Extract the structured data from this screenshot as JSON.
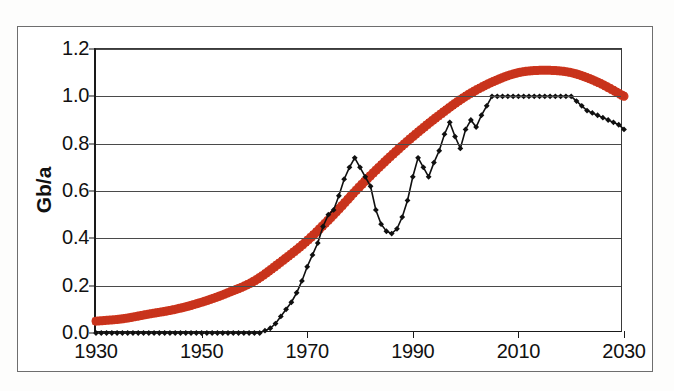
{
  "chart_data": {
    "type": "line",
    "title": "",
    "subtitle": "",
    "xlabel": "",
    "ylabel": "Gb/a",
    "xlim": [
      1930,
      2030
    ],
    "ylim": [
      0.0,
      1.2
    ],
    "xticks": [
      "1930",
      "1950",
      "1970",
      "1990",
      "2010",
      "2030"
    ],
    "xtick_values": [
      1930,
      1950,
      1970,
      1990,
      2010,
      2030
    ],
    "yticks": [
      "0.0",
      "0.2",
      "0.4",
      "0.6",
      "0.8",
      "1.0",
      "1.2"
    ],
    "ytick_values": [
      0.0,
      0.2,
      0.4,
      0.6,
      0.8,
      1.0,
      1.2
    ],
    "grid": "horizontal",
    "legend": "none",
    "colors": {
      "observed": "#101010",
      "model": "#d33a20"
    },
    "series": [
      {
        "name": "observed",
        "style": "black line with diamond markers",
        "x": [
          1930,
          1931,
          1932,
          1933,
          1934,
          1935,
          1936,
          1937,
          1938,
          1939,
          1940,
          1941,
          1942,
          1943,
          1944,
          1945,
          1946,
          1947,
          1948,
          1949,
          1950,
          1951,
          1952,
          1953,
          1954,
          1955,
          1956,
          1957,
          1958,
          1959,
          1960,
          1961,
          1962,
          1963,
          1964,
          1965,
          1966,
          1967,
          1968,
          1969,
          1970,
          1971,
          1972,
          1973,
          1974,
          1975,
          1976,
          1977,
          1978,
          1979,
          1980,
          1981,
          1982,
          1983,
          1984,
          1985,
          1986,
          1987,
          1988,
          1989,
          1990,
          1991,
          1992,
          1993,
          1994,
          1995,
          1996,
          1997,
          1998,
          1999,
          2000,
          2001,
          2002,
          2003,
          2004,
          2005,
          2006,
          2007,
          2008,
          2009,
          2010,
          2011,
          2012,
          2013,
          2014,
          2015,
          2016,
          2017,
          2018,
          2019,
          2020,
          2021,
          2022,
          2023,
          2024,
          2025,
          2026,
          2027,
          2028,
          2029,
          2030
        ],
        "y": [
          0.0,
          0.0,
          0.0,
          0.0,
          0.0,
          0.0,
          0.0,
          0.0,
          0.0,
          0.0,
          0.0,
          0.0,
          0.0,
          0.0,
          0.0,
          0.0,
          0.0,
          0.0,
          0.0,
          0.0,
          0.0,
          0.0,
          0.0,
          0.0,
          0.0,
          0.0,
          0.0,
          0.0,
          0.0,
          0.0,
          0.0,
          0.0,
          0.01,
          0.02,
          0.04,
          0.07,
          0.1,
          0.13,
          0.17,
          0.22,
          0.28,
          0.33,
          0.38,
          0.45,
          0.5,
          0.52,
          0.58,
          0.65,
          0.7,
          0.74,
          0.7,
          0.66,
          0.62,
          0.52,
          0.46,
          0.43,
          0.42,
          0.44,
          0.49,
          0.56,
          0.66,
          0.74,
          0.7,
          0.66,
          0.72,
          0.77,
          0.84,
          0.89,
          0.83,
          0.78,
          0.86,
          0.9,
          0.87,
          0.92,
          0.96,
          1.0,
          1.0,
          1.0,
          1.0,
          1.0,
          1.0,
          1.0,
          1.0,
          1.0,
          1.0,
          1.0,
          1.0,
          1.0,
          1.0,
          1.0,
          1.0,
          0.98,
          0.96,
          0.94,
          0.93,
          0.92,
          0.91,
          0.9,
          0.89,
          0.88,
          0.86
        ]
      },
      {
        "name": "model",
        "style": "thick red dotted curve",
        "x": [
          1930,
          1935,
          1940,
          1945,
          1950,
          1955,
          1960,
          1965,
          1970,
          1975,
          1980,
          1985,
          1990,
          1995,
          2000,
          2005,
          2010,
          2015,
          2020,
          2025,
          2030
        ],
        "y": [
          0.05,
          0.06,
          0.08,
          0.1,
          0.13,
          0.17,
          0.22,
          0.3,
          0.39,
          0.5,
          0.62,
          0.73,
          0.83,
          0.92,
          1.0,
          1.06,
          1.1,
          1.11,
          1.1,
          1.06,
          1.0
        ]
      }
    ]
  },
  "axis": {
    "ylabel": "Gb/a"
  }
}
